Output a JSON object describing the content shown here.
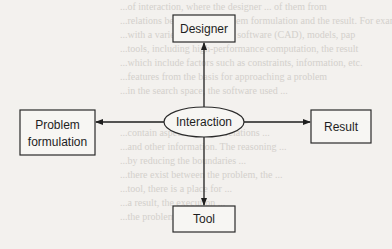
{
  "diagram": {
    "type": "hub-and-spoke flow diagram",
    "center": {
      "id": "interaction",
      "label": "Interaction",
      "shape": "ellipse"
    },
    "nodes": [
      {
        "id": "designer",
        "label": "Designer",
        "shape": "rect",
        "position": "top"
      },
      {
        "id": "problem",
        "label_lines": [
          "Problem",
          "formulation"
        ],
        "shape": "rect",
        "position": "left"
      },
      {
        "id": "result",
        "label": "Result",
        "shape": "rect",
        "position": "right"
      },
      {
        "id": "tool",
        "label": "Tool",
        "shape": "rect",
        "position": "bottom"
      }
    ],
    "edges": [
      {
        "from": "interaction",
        "to": "designer",
        "arrow": "to"
      },
      {
        "from": "interaction",
        "to": "problem",
        "arrow": "to"
      },
      {
        "from": "interaction",
        "to": "result",
        "arrow": "to"
      },
      {
        "from": "interaction",
        "to": "tool",
        "arrow": "to"
      }
    ],
    "colors": {
      "stroke": "#1e1e1e",
      "background": "#f3f1ee"
    }
  },
  "background_bleed_text": [
    "...of interaction, where the designer ... of them from",
    "...relations between the problem formulation and the result. For exam",
    "...with a variety of tools, e.g. software (CAD), models, pap",
    "...tools, including high-performance computation, the result",
    "...which include factors such as constraints, information, etc.",
    "...features from the basis for approaching a problem",
    "...in the search space, the software used ...",
    "",
    "",
    "...contain aspects of those relations ...",
    "...and other information. The reasoning ...",
    "...by reducing the boundaries ...",
    "...there exist between the problem, the ...",
    "...tool, there is a place for ...",
    "...a result, the execution ...",
    "...the problem ..."
  ]
}
